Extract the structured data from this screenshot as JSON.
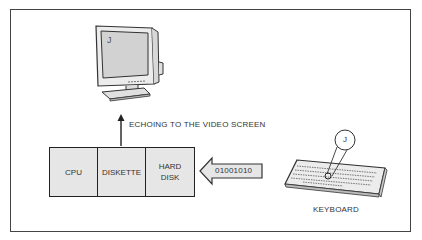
{
  "diagram": {
    "monitor": {
      "screen_char": "J"
    },
    "echo_label": "ECHOING TO THE VIDEO SCREEN",
    "blocks": [
      {
        "line1": "CPU",
        "line2": ""
      },
      {
        "line1": "DISKETTE",
        "line2": ""
      },
      {
        "line1": "HARD",
        "line2": "DISK"
      }
    ],
    "data_arrow_label": "01001010",
    "key_callout": "J",
    "keyboard_label": "KEYBOARD"
  }
}
